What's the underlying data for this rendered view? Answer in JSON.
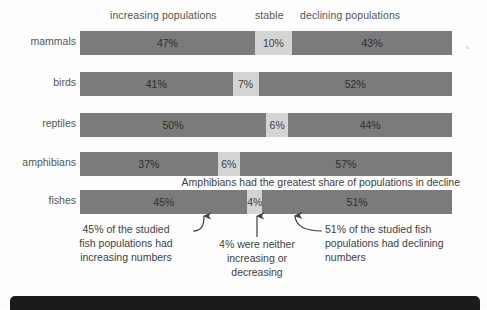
{
  "chart_data": {
    "type": "bar",
    "orientation": "horizontal",
    "stacked": true,
    "title": "",
    "xlabel": "",
    "ylabel": "",
    "xlim": [
      0,
      100
    ],
    "grid": false,
    "legend_position": "top",
    "categories": [
      "mammals",
      "birds",
      "reptiles",
      "amphibians",
      "fishes"
    ],
    "series": [
      {
        "name": "increasing populations",
        "values": [
          47,
          41,
          50,
          37,
          45
        ]
      },
      {
        "name": "stable",
        "values": [
          10,
          7,
          6,
          6,
          4
        ]
      },
      {
        "name": "declining populations",
        "values": [
          43,
          52,
          44,
          57,
          51
        ]
      }
    ],
    "value_labels": {
      "mammals": [
        "47%",
        "10%",
        "43%"
      ],
      "birds": [
        "41%",
        "7%",
        "52%"
      ],
      "reptiles": [
        "50%",
        "6%",
        "44%"
      ],
      "amphibians": [
        "37%",
        "6%",
        "57%"
      ],
      "fishes": [
        "45%",
        "4%",
        "51%"
      ]
    },
    "colors": {
      "increasing": "#7b7b7b",
      "stable": "#d4d4d4",
      "declining": "#7b7b7b",
      "background": "#fdfdfd",
      "text": "#3f3f3f"
    },
    "annotations": [
      "Amphibians had the greatest share of populations in decline",
      "45% of the studied fish populations had increasing numbers",
      "4% were neither increasing or decreasing",
      "51% of the studied fish populations had declining numbers"
    ]
  },
  "headers": {
    "increasing": "increasing populations",
    "stable": "stable",
    "declining": "declining populations"
  },
  "rows": {
    "mammals": {
      "label": "mammals",
      "inc_label": "47%",
      "sta_label": "10%",
      "dec_label": "43%",
      "inc_pct": 47,
      "sta_pct": 10,
      "dec_pct": 43
    },
    "birds": {
      "label": "birds",
      "inc_label": "41%",
      "sta_label": "7%",
      "dec_label": "52%",
      "inc_pct": 41,
      "sta_pct": 7,
      "dec_pct": 52
    },
    "reptiles": {
      "label": "reptiles",
      "inc_label": "50%",
      "sta_label": "6%",
      "dec_label": "44%",
      "inc_pct": 50,
      "sta_pct": 6,
      "dec_pct": 44
    },
    "amphibians": {
      "label": "amphibians",
      "inc_label": "37%",
      "sta_label": "6%",
      "dec_label": "57%",
      "inc_pct": 37,
      "sta_pct": 6,
      "dec_pct": 57
    },
    "fishes": {
      "label": "fishes",
      "inc_label": "45%",
      "sta_label": "4%",
      "dec_label": "51%",
      "inc_pct": 45,
      "sta_pct": 4,
      "dec_pct": 51
    }
  },
  "captions": {
    "amphibians_note": "Amphibians had the greatest share of populations in decline",
    "left_note_line1": "45% of the studied",
    "left_note_line2": "fish populations had",
    "left_note_line3": "increasing numbers",
    "mid_note_line1": "4% were neither",
    "mid_note_line2": "increasing or",
    "mid_note_line3": "decreasing",
    "right_note_line1": "51% of the studied fish",
    "right_note_line2": "populations had declining",
    "right_note_line3": "numbers"
  }
}
